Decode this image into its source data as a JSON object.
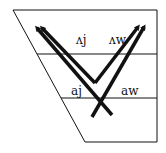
{
  "diagram": {
    "type": "vowel-trapezoid",
    "labels": {
      "upper_left": "ʌj",
      "upper_right": "ʌw",
      "lower_left": "aj",
      "lower_right": "aw"
    },
    "arrows": [
      {
        "name": "ʌj",
        "direction": "up-left"
      },
      {
        "name": "ʌw",
        "direction": "up-right"
      },
      {
        "name": "aj",
        "direction": "up-left"
      },
      {
        "name": "aw",
        "direction": "up-right"
      }
    ],
    "colors": {
      "stroke": "#111111",
      "background": "#ffffff"
    }
  }
}
